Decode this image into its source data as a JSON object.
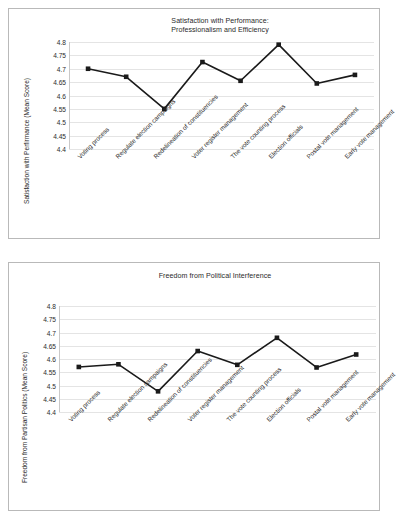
{
  "page": {
    "background_color": "#ffffff",
    "panel_border_color": "#b9b9b9",
    "gridline_color": "#e4e4e4",
    "series_color": "#1a1a1a"
  },
  "chart_data": [
    {
      "id": "satisfaction-with-performance",
      "type": "line",
      "title": "Satisfaction with Performance:\nProfessionalism and Efficiency",
      "xlabel": "",
      "ylabel": "Satisfaction with Perfirmance (Mean Score)",
      "ylim": [
        4.4,
        4.8
      ],
      "yticks": [
        "4.8",
        "4.75",
        "4.7",
        "4.65",
        "4.6",
        "4.55",
        "4.5",
        "4.45",
        "4.4"
      ],
      "ytick_values": [
        4.8,
        4.75,
        4.7,
        4.65,
        4.6,
        4.55,
        4.5,
        4.45,
        4.4
      ],
      "grid": true,
      "legend": "none",
      "marker": "square",
      "categories": [
        "Voting process",
        "Regulate election campaigns",
        "Redelineation of constituencies",
        "Voter register management",
        "The vote counting process",
        "Election officials",
        "Postal vote management",
        "Early vote management"
      ],
      "values": [
        4.7,
        4.67,
        4.55,
        4.725,
        4.655,
        4.79,
        4.645,
        4.677
      ]
    },
    {
      "id": "freedom-from-political-interference",
      "type": "line",
      "title": "Freedom from Political Interference",
      "xlabel": "",
      "ylabel": "Freedom from Partisan Politics (Mean Score)",
      "ylim": [
        4.4,
        4.8
      ],
      "yticks": [
        "4.8",
        "4.75",
        "4.7",
        "4.65",
        "4.6",
        "4.55",
        "4.5",
        "4.45",
        "4.4"
      ],
      "ytick_values": [
        4.8,
        4.75,
        4.7,
        4.65,
        4.6,
        4.55,
        4.5,
        4.45,
        4.4
      ],
      "grid": true,
      "legend": "none",
      "marker": "square",
      "categories": [
        "Voting process",
        "Regulate election campaigns",
        "Redelineation of constituencies",
        "Voter register management",
        "The vote counting process",
        "Election officials",
        "Postal vote management",
        "Early vote management"
      ],
      "values": [
        4.57,
        4.58,
        4.478,
        4.63,
        4.578,
        4.68,
        4.568,
        4.617
      ]
    }
  ]
}
